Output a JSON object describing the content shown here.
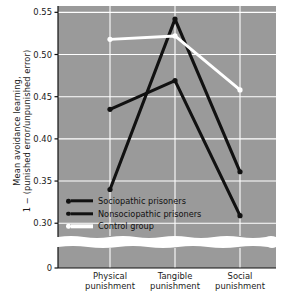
{
  "chart_data": {
    "type": "line",
    "title": "",
    "xlabel": "",
    "ylabel_line1": "Mean avoidance learning,",
    "ylabel_line2": "1 − (punished error/unpunished error)",
    "categories": [
      "Physical punishment",
      "Tangible punishment",
      "Social punishment"
    ],
    "category_lines": [
      [
        "Physical",
        "punishment"
      ],
      [
        "Tangible",
        "punishment"
      ],
      [
        "Social",
        "punishment"
      ]
    ],
    "yticks": [
      "0.55",
      "0.50",
      "0.45",
      "0.40",
      "0.35",
      "0.30"
    ],
    "ytick_values": [
      0.55,
      0.5,
      0.45,
      0.4,
      0.35,
      0.3
    ],
    "ylim": [
      0.3,
      0.55
    ],
    "axis_break_label": "0",
    "grid": true,
    "legend_position": "inside-lower-left",
    "series": [
      {
        "name": "Sociopathic prisoners",
        "color": "#111111",
        "marker_color": "#111111",
        "values": [
          0.435,
          0.469,
          0.309
        ]
      },
      {
        "name": "Nonsociopathic prisoners",
        "color": "#111111",
        "marker_color": "#111111",
        "values": [
          0.34,
          0.542,
          0.361
        ]
      },
      {
        "name": "Control group",
        "color": "#ffffff",
        "marker_color": "#ffffff",
        "values": [
          0.518,
          0.522,
          0.458
        ]
      }
    ],
    "plot_background": "#9a9a9a",
    "grid_color": "#ffffff",
    "page_background": "#ffffff"
  }
}
